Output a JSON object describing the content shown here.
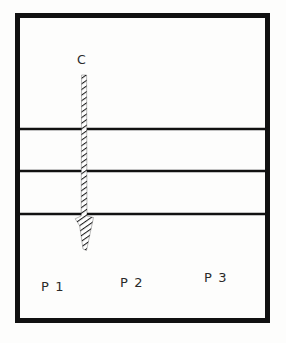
{
  "figure": {
    "title": "",
    "background_color": "#fdfdfc",
    "stroke_color": "#111111",
    "text_color": "#2a2a2a",
    "outer_box": {
      "name": "specimen-outline",
      "x": 15,
      "y": 13,
      "width": 255,
      "height": 310,
      "border_width": 5
    },
    "horizontal_lines": [
      {
        "name": "layer-boundary-1",
        "y": 129,
        "thickness": 2.6
      },
      {
        "name": "layer-boundary-2",
        "y": 171,
        "thickness": 2.6
      },
      {
        "name": "layer-boundary-3",
        "y": 214,
        "thickness": 2.6
      }
    ],
    "arrow": {
      "name": "crack-propagation-arrow",
      "style": "hatched",
      "center_x": 84,
      "start_y": 75,
      "tip_y": 250,
      "shaft_width": 5,
      "head_start_y": 218,
      "head_width": 18,
      "hatch_angle": 55,
      "hatch_spacing": 3.2
    },
    "labels": {
      "crack": "C",
      "ply_1": "P 1",
      "ply_2": "P 2",
      "ply_3": "P 3"
    }
  }
}
